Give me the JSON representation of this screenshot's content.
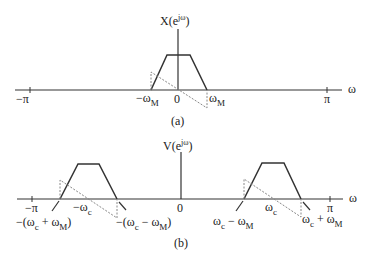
{
  "panel_a": {
    "caption": "(a)",
    "ylabel": "X(e",
    "ylabel_sup": "jω",
    "ylabel_close": ")",
    "xlabel": "ω",
    "ticks": {
      "neg_pi": "−π",
      "pi": "π",
      "zero": "0",
      "neg_wM": "−ω",
      "wM": "ω",
      "sub_M": "M"
    }
  },
  "panel_b": {
    "caption": "(b)",
    "ylabel": "V(e",
    "ylabel_sup": "jω",
    "ylabel_close": ")",
    "xlabel": "ω",
    "ticks": {
      "neg_pi": "−π",
      "pi": "π",
      "zero": "0",
      "neg_wc": "−ω",
      "wc": "ω",
      "sub_c": "c"
    },
    "annotations": {
      "left_outer": "−(ω",
      "left_outer_mid": " + ω",
      "left_outer_end": ")",
      "left_inner": "−(ω",
      "left_inner_mid": " − ω",
      "left_inner_end": ")",
      "right_inner": "ω",
      "right_inner_mid": " − ω",
      "right_outer": "ω",
      "right_outer_mid": " + ω",
      "sub_c": "c",
      "sub_M": "M"
    }
  }
}
